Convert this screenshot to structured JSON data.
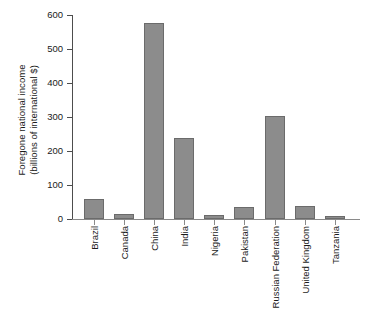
{
  "chart_data": {
    "type": "bar",
    "title": "",
    "subtitle": "",
    "xlabel": "",
    "ylabel": "Foregone national income (billions of international $)",
    "ylabel_line1": "Foregone national income",
    "ylabel_line2": "(billions of international $)",
    "categories": [
      "Brazil",
      "Canada",
      "China",
      "India",
      "Nigeria",
      "Pakistan",
      "Russian Federation",
      "United Kingdom",
      "Tanzania"
    ],
    "values": [
      58,
      14,
      577,
      239,
      13,
      35,
      304,
      38,
      8
    ],
    "ylim": [
      0,
      600
    ],
    "yticks": [
      0,
      100,
      200,
      300,
      400,
      500,
      600
    ],
    "ytick_labels": [
      "0",
      "100",
      "200",
      "300",
      "400",
      "500",
      "600"
    ],
    "grid": false,
    "legend": "none",
    "bar_color": "#8c8c8c",
    "bar_edge_color": "#6b6b6b",
    "axis_color": "#4d4d4d",
    "background": "#ffffff"
  }
}
